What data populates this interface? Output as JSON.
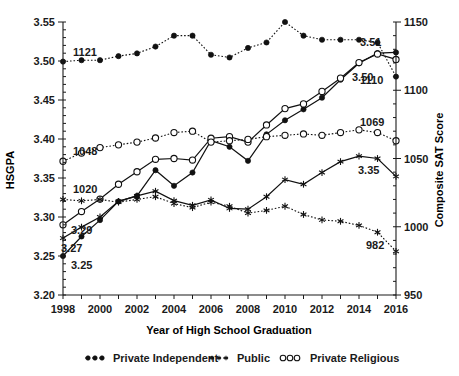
{
  "chart_data": {
    "type": "line",
    "title": "",
    "xlabel": "Year of High School Graduation",
    "ylabel": "HSGPA",
    "ylabel_right": "Composite SAT Score",
    "x": [
      1998,
      1999,
      2000,
      2001,
      2002,
      2003,
      2004,
      2005,
      2006,
      2007,
      2008,
      2009,
      2010,
      2011,
      2012,
      2013,
      2014,
      2015,
      2016
    ],
    "xticks": [
      1998,
      2000,
      2002,
      2004,
      2006,
      2008,
      2010,
      2012,
      2014,
      2016
    ],
    "xlim": [
      1998,
      2016
    ],
    "yticks": [
      "3.20",
      "3.25",
      "3.30",
      "3.35",
      "3.40",
      "3.45",
      "3.50",
      "3.55"
    ],
    "ylim": [
      3.2,
      3.55
    ],
    "yticks_right": [
      "950",
      "1000",
      "1050",
      "1100",
      "1150"
    ],
    "ylim_right": [
      950,
      1150
    ],
    "grid": false,
    "legend_position": "bottom",
    "series": [
      {
        "name": "Private Independent HSGPA",
        "axis": "left",
        "line": "solid",
        "marker": "filled-circle",
        "values": [
          3.25,
          3.275,
          3.296,
          3.32,
          3.327,
          3.36,
          3.34,
          3.357,
          3.398,
          3.39,
          3.372,
          3.406,
          3.424,
          3.438,
          3.453,
          3.476,
          3.497,
          3.51,
          3.511
        ]
      },
      {
        "name": "Public HSGPA",
        "axis": "left",
        "line": "solid",
        "marker": "star",
        "values": [
          3.273,
          3.287,
          3.3,
          3.32,
          3.327,
          3.333,
          3.321,
          3.315,
          3.322,
          3.311,
          3.31,
          3.326,
          3.348,
          3.342,
          3.357,
          3.371,
          3.378,
          3.375,
          3.352
        ]
      },
      {
        "name": "Private Religious HSGPA",
        "axis": "left",
        "line": "solid",
        "marker": "open-circle",
        "values": [
          3.29,
          3.307,
          3.323,
          3.342,
          3.358,
          3.374,
          3.375,
          3.373,
          3.401,
          3.403,
          3.396,
          3.418,
          3.439,
          3.445,
          3.461,
          3.478,
          3.498,
          3.509,
          3.502
        ]
      },
      {
        "name": "Private Independent SAT",
        "axis": "right",
        "line": "dotted",
        "marker": "filled-circle",
        "values": [
          1121,
          1122,
          1122,
          1125,
          1127,
          1132,
          1140,
          1140,
          1126,
          1124,
          1131,
          1135,
          1150,
          1140,
          1137,
          1137,
          1137,
          1135,
          1110
        ]
      },
      {
        "name": "Public SAT",
        "axis": "right",
        "line": "dotted",
        "marker": "star",
        "values": [
          1020,
          1019,
          1020,
          1018,
          1020,
          1022,
          1017,
          1014,
          1018,
          1015,
          1010,
          1012,
          1015,
          1009,
          1005,
          1004,
          1001,
          996,
          982
        ]
      },
      {
        "name": "Private Religious SAT",
        "axis": "right",
        "line": "dotted",
        "marker": "open-circle",
        "values": [
          1048,
          1054,
          1058,
          1060,
          1062,
          1065,
          1069,
          1070,
          1062,
          1063,
          1064,
          1066,
          1067,
          1068,
          1067,
          1069,
          1071,
          1069,
          1063
        ]
      }
    ],
    "annotations": [
      {
        "text": "1121",
        "x": 1998,
        "value": 1121,
        "axis": "right",
        "dx": 10,
        "dy": -6
      },
      {
        "text": "1048",
        "x": 1998,
        "value": 1048,
        "axis": "right",
        "dx": 10,
        "dy": -6
      },
      {
        "text": "1020",
        "x": 1998,
        "value": 1020,
        "axis": "right",
        "dx": 10,
        "dy": -6
      },
      {
        "text": "3.29",
        "x": 1998,
        "value": 3.29,
        "axis": "left",
        "dx": 8,
        "dy": 9
      },
      {
        "text": "3.27",
        "x": 1998,
        "value": 3.27,
        "axis": "left",
        "dx": -2,
        "dy": 12
      },
      {
        "text": "3.25",
        "x": 1998,
        "value": 3.25,
        "axis": "left",
        "dx": 8,
        "dy": 13
      },
      {
        "text": "3.51",
        "x": 2016,
        "value": 3.511,
        "axis": "left",
        "dx": -36,
        "dy": -6
      },
      {
        "text": "3.50",
        "x": 2016,
        "value": 3.502,
        "axis": "left",
        "dx": -44,
        "dy": 22
      },
      {
        "text": "1110",
        "x": 2016,
        "value": 1110,
        "axis": "right",
        "dx": -36,
        "dy": 7
      },
      {
        "text": "1069",
        "x": 2016,
        "value": 1069,
        "axis": "right",
        "dx": -36,
        "dy": -7
      },
      {
        "text": "3.35",
        "x": 2016,
        "value": 3.352,
        "axis": "left",
        "dx": -38,
        "dy": -2
      },
      {
        "text": "982",
        "x": 2016,
        "value": 982,
        "axis": "right",
        "dx": -30,
        "dy": -2
      }
    ],
    "legend": [
      {
        "label": "Private Independent",
        "marker": "filled-circle"
      },
      {
        "label": "Public",
        "marker": "star"
      },
      {
        "label": "Private Religious",
        "marker": "open-circle"
      }
    ]
  }
}
